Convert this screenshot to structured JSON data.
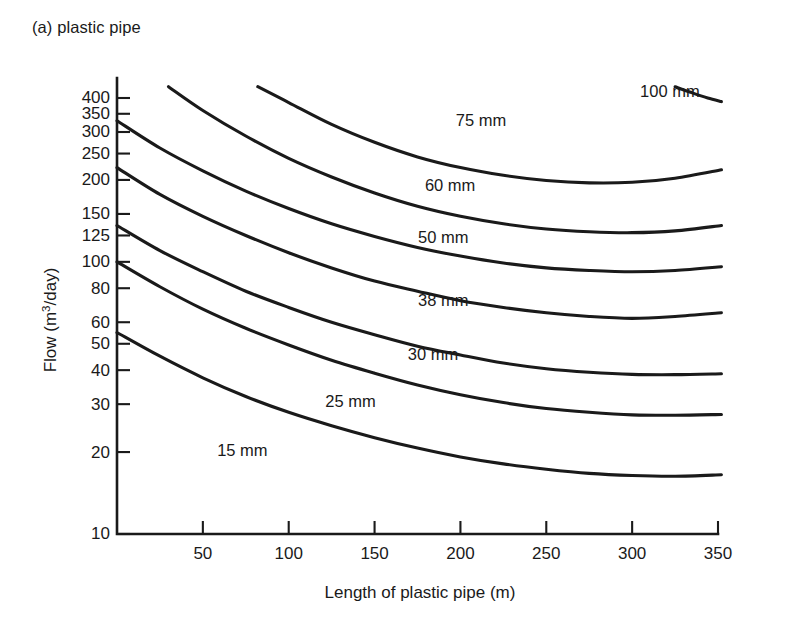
{
  "figure": {
    "caption": "(a) plastic pipe"
  },
  "chart_data": {
    "type": "line",
    "title": "(a) plastic pipe",
    "xlabel": "Length of plastic pipe (m)",
    "ylabel": "Flow (m3/day)",
    "ylabel_base": "Flow (m",
    "ylabel_sup": "3",
    "ylabel_tail": "/day)",
    "xscale": "linear",
    "yscale": "log",
    "xlim": [
      0,
      350
    ],
    "ylim": [
      10,
      450
    ],
    "grid": false,
    "legend": "inline-curve-labels",
    "xticks": [
      50,
      100,
      150,
      200,
      250,
      300,
      350
    ],
    "xtick_labels": [
      "50",
      "100",
      "150",
      "200",
      "250",
      "300",
      "350"
    ],
    "yticks": [
      10,
      20,
      30,
      40,
      50,
      60,
      80,
      100,
      125,
      150,
      200,
      250,
      300,
      350,
      400
    ],
    "ytick_labels": [
      "10",
      "20",
      "30",
      "40",
      "50",
      "60",
      "80",
      "100",
      "125",
      "150",
      "200",
      "250",
      "300",
      "350",
      "400"
    ],
    "series": [
      {
        "name": "100 mm",
        "label": "100 mm",
        "label_x": 322,
        "label_y": 420,
        "x": [
          325,
          334,
          344,
          352
        ],
        "y": [
          440,
          420,
          400,
          388
        ]
      },
      {
        "name": "75 mm",
        "label": "75 mm",
        "label_x": 212,
        "label_y": 330,
        "x": [
          82,
          100,
          125,
          150,
          175,
          200,
          225,
          250,
          275,
          300,
          325,
          352
        ],
        "y": [
          440,
          385,
          320,
          275,
          243,
          222,
          208,
          199,
          195,
          196,
          203,
          218
        ]
      },
      {
        "name": "60 mm",
        "label": "60 mm",
        "label_x": 194,
        "label_y": 190,
        "x": [
          30,
          50,
          75,
          100,
          125,
          150,
          175,
          200,
          225,
          250,
          275,
          300,
          325,
          352
        ],
        "y": [
          440,
          360,
          290,
          240,
          205,
          179,
          160,
          147,
          138,
          132,
          129,
          128,
          130,
          136
        ]
      },
      {
        "name": "50 mm",
        "label": "50 mm",
        "label_x": 190,
        "label_y": 122,
        "x": [
          0,
          25,
          50,
          75,
          100,
          125,
          150,
          175,
          200,
          225,
          250,
          275,
          300,
          325,
          352
        ],
        "y": [
          330,
          262,
          216,
          182,
          157,
          138,
          124,
          113,
          105,
          99,
          95,
          93,
          92,
          93,
          96
        ]
      },
      {
        "name": "38 mm",
        "label": "38 mm",
        "label_x": 190,
        "label_y": 72,
        "x": [
          0,
          25,
          50,
          75,
          100,
          125,
          150,
          175,
          200,
          225,
          250,
          275,
          300,
          325,
          352
        ],
        "y": [
          222,
          177,
          147,
          125,
          108,
          95,
          85,
          78,
          72,
          68,
          65,
          63,
          62,
          63,
          65
        ]
      },
      {
        "name": "30 mm",
        "label": "30 mm",
        "label_x": 184,
        "label_y": 45.5,
        "x": [
          0,
          25,
          50,
          75,
          100,
          125,
          150,
          175,
          200,
          225,
          250,
          275,
          300,
          325,
          352
        ],
        "y": [
          136,
          110,
          92,
          78,
          68,
          60,
          54,
          49,
          45.5,
          42.5,
          40.5,
          39.3,
          38.6,
          38.5,
          38.8
        ]
      },
      {
        "name": "25 mm",
        "label": "25 mm",
        "label_x": 136,
        "label_y": 30.5,
        "x": [
          0,
          25,
          50,
          75,
          100,
          125,
          150,
          175,
          200,
          225,
          250,
          275,
          300,
          325,
          352
        ],
        "y": [
          100,
          81,
          67,
          57,
          49.5,
          43.5,
          39,
          35.3,
          32.5,
          30.4,
          28.9,
          28.0,
          27.4,
          27.3,
          27.5
        ]
      },
      {
        "name": "15 mm",
        "label": "15 mm",
        "label_x": 73,
        "label_y": 20.2,
        "x": [
          0,
          25,
          50,
          75,
          100,
          125,
          150,
          175,
          200,
          225,
          250,
          275,
          300,
          325,
          352
        ],
        "y": [
          55,
          45,
          37.5,
          32,
          28,
          25,
          22.6,
          20.7,
          19.2,
          18.1,
          17.3,
          16.7,
          16.4,
          16.3,
          16.5
        ]
      }
    ]
  }
}
